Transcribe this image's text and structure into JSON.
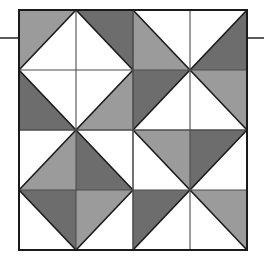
{
  "figure": {
    "background_color": "#ffffff"
  },
  "colors": {
    "white": "#ffffff",
    "light_gray": "#9b9b9b",
    "dark_gray": "#6d6d6d",
    "outline": "#1a1a1a",
    "grid_line": "#4d4d4d",
    "tick_line": "#5a5a5a"
  },
  "canvas": {
    "width": 264,
    "height": 271
  },
  "square": {
    "left": 19,
    "top": 10,
    "right": 247,
    "bottom": 250,
    "width": 228,
    "height": 240,
    "border_width": 2,
    "rows": 4,
    "cols": 4,
    "cell_width": 57,
    "cell_height": 60
  },
  "ticks": [
    {
      "name": "left-tick",
      "x1": 0,
      "y1": 38,
      "x2": 19,
      "y2": 38
    },
    {
      "name": "right-tick",
      "x1": 247,
      "y1": 38,
      "x2": 264,
      "y2": 38
    }
  ],
  "chart_data": {
    "type": "heatmap",
    "xlabel": "",
    "ylabel": "",
    "grid": true,
    "legend": "none",
    "rows": 4,
    "cols": 4,
    "palette": [
      "white",
      "light_gray",
      "dark_gray"
    ],
    "cells": [
      {
        "row": 0,
        "col": 0,
        "diagonal": "tlbr",
        "upper_fill": "light_gray",
        "lower_fill": "white"
      },
      {
        "row": 0,
        "col": 1,
        "diagonal": "trbl",
        "upper_fill": "dark_gray",
        "lower_fill": "white"
      },
      {
        "row": 0,
        "col": 2,
        "diagonal": "trbl",
        "upper_fill": "white",
        "lower_fill": "light_gray"
      },
      {
        "row": 0,
        "col": 3,
        "diagonal": "tlbr",
        "upper_fill": "white",
        "lower_fill": "dark_gray"
      },
      {
        "row": 1,
        "col": 0,
        "diagonal": "trbl",
        "upper_fill": "white",
        "lower_fill": "dark_gray"
      },
      {
        "row": 1,
        "col": 1,
        "diagonal": "tlbr",
        "upper_fill": "white",
        "lower_fill": "light_gray"
      },
      {
        "row": 1,
        "col": 2,
        "diagonal": "tlbr",
        "upper_fill": "dark_gray",
        "lower_fill": "white"
      },
      {
        "row": 1,
        "col": 3,
        "diagonal": "trbl",
        "upper_fill": "light_gray",
        "lower_fill": "white"
      },
      {
        "row": 2,
        "col": 0,
        "diagonal": "tlbr",
        "upper_fill": "white",
        "lower_fill": "light_gray"
      },
      {
        "row": 2,
        "col": 1,
        "diagonal": "trbl",
        "upper_fill": "white",
        "lower_fill": "dark_gray"
      },
      {
        "row": 2,
        "col": 2,
        "diagonal": "trbl",
        "upper_fill": "light_gray",
        "lower_fill": "white"
      },
      {
        "row": 2,
        "col": 3,
        "diagonal": "tlbr",
        "upper_fill": "dark_gray",
        "lower_fill": "white"
      },
      {
        "row": 3,
        "col": 0,
        "diagonal": "trbl",
        "upper_fill": "dark_gray",
        "lower_fill": "white"
      },
      {
        "row": 3,
        "col": 1,
        "diagonal": "tlbr",
        "upper_fill": "light_gray",
        "lower_fill": "white"
      },
      {
        "row": 3,
        "col": 2,
        "diagonal": "tlbr",
        "upper_fill": "dark_gray",
        "lower_fill": "white"
      },
      {
        "row": 3,
        "col": 3,
        "diagonal": "trbl",
        "upper_fill": "light_gray",
        "lower_fill": "white"
      }
    ]
  }
}
